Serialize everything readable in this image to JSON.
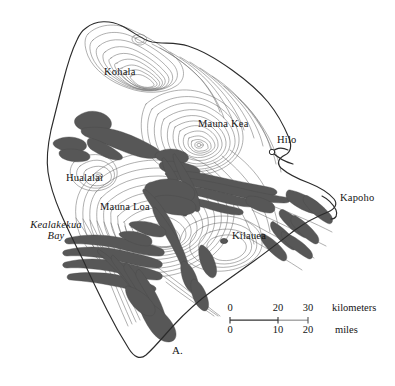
{
  "figure": {
    "panel_letter": "A.",
    "region": "Island of Hawaii"
  },
  "labels": {
    "kohala": "Kohala",
    "mauna_kea": "Mauna Kea",
    "hilo": "Hilo",
    "hualalai": "Hualalai",
    "mauna_loa": "Mauna Loa",
    "kilauea": "Kilauea",
    "kapoho": "Kapoho",
    "kealakekua_bay_line1": "Kealakekua",
    "kealakekua_bay_line2": "Bay"
  },
  "scale": {
    "km_ticks": [
      "0",
      "20",
      "30"
    ],
    "km_unit": "kilometers",
    "mi_ticks": [
      "0",
      "10",
      "20"
    ],
    "mi_unit": "miles"
  },
  "colors": {
    "lava_flow": "#575757",
    "contour_line": "#6b6b6b",
    "coastline": "#2b2b2b",
    "text": "#141414",
    "scale_dark": "#333333",
    "scale_light": "#9a9a9a",
    "background": "#ffffff"
  },
  "map_content": {
    "type": "topographic-map",
    "contour_lines": true,
    "shaded_features": "historic lava flows and rift zones",
    "point_markers": [
      "hilo",
      "kilauea",
      "mauna-kea-summit",
      "hualalai-summit"
    ]
  }
}
